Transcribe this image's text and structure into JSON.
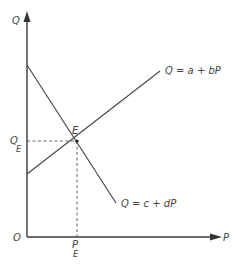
{
  "diagram": {
    "type": "supply-demand-equilibrium",
    "axes": {
      "y_label": "Q",
      "x_label": "P",
      "origin_label": "O"
    },
    "lines": [
      {
        "id": "supply",
        "equation": "Q = a + bP",
        "slope": "positive"
      },
      {
        "id": "demand",
        "equation": "Q = c + dP",
        "slope": "negative"
      }
    ],
    "equilibrium": {
      "point_label": "E",
      "q_label_main": "Q",
      "q_label_sub": "E",
      "p_label_main": "P",
      "p_label_sub": "E"
    }
  }
}
